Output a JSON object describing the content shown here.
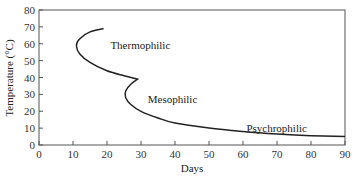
{
  "chart_data": {
    "type": "line",
    "title": "",
    "xlabel": "Days",
    "ylabel": "Temperature (°C)",
    "xlim": [
      0,
      90
    ],
    "ylim": [
      0,
      80
    ],
    "x_ticks": [
      0,
      10,
      20,
      30,
      40,
      50,
      60,
      70,
      80,
      90
    ],
    "y_ticks": [
      0,
      10,
      20,
      30,
      40,
      50,
      60,
      70,
      80
    ],
    "grid": false,
    "legend": "none",
    "series": [
      {
        "name": "Temperature profile",
        "points": [
          [
            19,
            69
          ],
          [
            15,
            67
          ],
          [
            12,
            63
          ],
          [
            11,
            59
          ],
          [
            12,
            54
          ],
          [
            15,
            49
          ],
          [
            20,
            44
          ],
          [
            25,
            41
          ],
          [
            29,
            39
          ],
          [
            27,
            36
          ],
          [
            25.5,
            32
          ],
          [
            25.5,
            28
          ],
          [
            27,
            24
          ],
          [
            30,
            20
          ],
          [
            35,
            16
          ],
          [
            40,
            13
          ],
          [
            50,
            10
          ],
          [
            60,
            8
          ],
          [
            70,
            6.5
          ],
          [
            80,
            5.5
          ],
          [
            90,
            5
          ]
        ]
      }
    ],
    "annotations": [
      {
        "text": "Thermophilic",
        "x": 21,
        "y": 59
      },
      {
        "text": "Mesophilic",
        "x": 32,
        "y": 27
      },
      {
        "text": "Psychrophilic",
        "x": 61,
        "y": 10
      }
    ]
  }
}
